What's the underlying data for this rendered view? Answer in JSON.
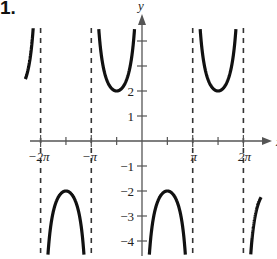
{
  "problem": {
    "label": "1."
  },
  "chart_data": {
    "type": "line",
    "title": "",
    "function": "y = -2 csc(x)",
    "xlabel": "x",
    "ylabel": "y",
    "xlim": [
      -2.3,
      2.65
    ],
    "xlim_units": "pi",
    "ylim": [
      -4.5,
      4.5
    ],
    "grid": false,
    "legend": null,
    "x_ticks": [
      {
        "value_pi": -2,
        "label": "−2π"
      },
      {
        "value_pi": -1.5,
        "label": ""
      },
      {
        "value_pi": -1,
        "label": "−π"
      },
      {
        "value_pi": -0.5,
        "label": ""
      },
      {
        "value_pi": 0.5,
        "label": ""
      },
      {
        "value_pi": 1,
        "label": "π"
      },
      {
        "value_pi": 1.5,
        "label": ""
      },
      {
        "value_pi": 2,
        "label": "2π"
      }
    ],
    "y_ticks": [
      {
        "value": 4,
        "label": ""
      },
      {
        "value": 3,
        "label": ""
      },
      {
        "value": 2,
        "label": "2"
      },
      {
        "value": 1,
        "label": "1"
      },
      {
        "value": -1,
        "label": "−1"
      },
      {
        "value": -2,
        "label": "−2"
      },
      {
        "value": -3,
        "label": "−3"
      },
      {
        "value": -4,
        "label": "−4"
      }
    ],
    "asymptotes_pi": [
      -2,
      -1,
      1,
      2
    ],
    "key_points": [
      {
        "x": "-3π/2",
        "y": -2,
        "kind": "local max"
      },
      {
        "x": "-π/2",
        "y": 2,
        "kind": "local min"
      },
      {
        "x": "π/2",
        "y": -2,
        "kind": "local max"
      },
      {
        "x": "3π/2",
        "y": 2,
        "kind": "local min"
      }
    ]
  },
  "style": {
    "curve_color": "#111111",
    "axis_color": "#555555",
    "asymptote_color": "#333333"
  }
}
